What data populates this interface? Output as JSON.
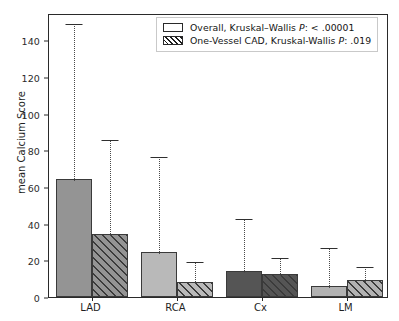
{
  "chart_data": {
    "type": "bar",
    "title": "",
    "xlabel": "",
    "ylabel": "mean Calcium Score",
    "categories": [
      "LAD",
      "RCA",
      "Cx",
      "LM"
    ],
    "ylim": [
      0,
      155
    ],
    "yticks": [
      0,
      20,
      40,
      60,
      80,
      100,
      120,
      140
    ],
    "ytick_labels": [
      "0",
      "20",
      "40",
      "60",
      "80",
      "100",
      "120",
      "140"
    ],
    "grid": false,
    "legend_position": "upper right",
    "series": [
      {
        "name": "Overall, Kruskal–Wallis P: < .00001",
        "hatch": "none",
        "values": [
          64.2,
          24.3,
          14.1,
          6.2
        ],
        "error_upper": [
          150.0,
          77.7,
          43.5,
          27.6
        ]
      },
      {
        "name": "One-Vessel CAD, Kruskal-Wallis P: .019",
        "hatch": "diagonal",
        "values": [
          34.2,
          8.4,
          12.5,
          9.1
        ],
        "error_upper": [
          86.8,
          20.1,
          22.3,
          17.2
        ]
      }
    ],
    "group_colors": [
      "#949494",
      "#b9b9b9",
      "#555555",
      "#b2b2b2"
    ]
  },
  "legend": {
    "items": [
      {
        "swatch": "plain",
        "prefix": "Overall, Kruskal–Wallis ",
        "italic": "P",
        "suffix": ": < .00001"
      },
      {
        "swatch": "hatched",
        "prefix": "One-Vessel CAD, Kruskal-Wallis ",
        "italic": "P",
        "suffix": ": .019"
      }
    ]
  },
  "axis": {
    "y_label": "mean Calcium Score"
  }
}
